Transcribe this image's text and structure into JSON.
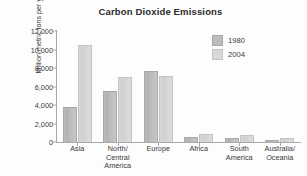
{
  "chart_data": {
    "type": "bar",
    "title": "Carbon Dioxide Emissions",
    "xlabel": "",
    "ylabel": "Million metric tons per year",
    "categories": [
      "Asia",
      "North/\nCentral\nAmerica",
      "Europe",
      "Africa",
      "South\nAmerica",
      "Australia/\nOceania"
    ],
    "series": [
      {
        "name": "1980",
        "color": "#bcbcbc",
        "values": [
          3800,
          5550,
          7650,
          500,
          400,
          200
        ]
      },
      {
        "name": "2004",
        "color": "#d9d9d9",
        "values": [
          10500,
          7000,
          7100,
          900,
          750,
          400
        ]
      }
    ],
    "ylim": [
      0,
      12000
    ],
    "yticks": [
      0,
      2000,
      4000,
      6000,
      8000,
      10000,
      12000
    ],
    "ytick_labels": [
      "0",
      "2,000",
      "4,000",
      "6,000",
      "8,000",
      "10,000",
      "12,000"
    ],
    "grid": false,
    "legend_position": "upper right"
  },
  "legend": {
    "entries": [
      {
        "label": "1980"
      },
      {
        "label": "2004"
      }
    ]
  }
}
